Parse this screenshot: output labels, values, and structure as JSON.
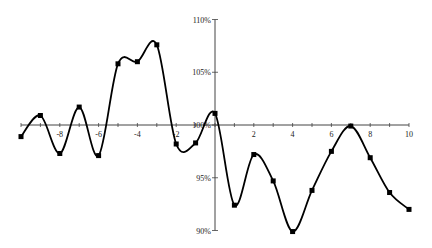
{
  "chart_data": {
    "type": "line",
    "title": "",
    "xlabel": "",
    "ylabel": "",
    "smooth": true,
    "x": [
      -10,
      -9,
      -8,
      -7,
      -6,
      -5,
      -4,
      -3,
      -2,
      -1,
      0,
      1,
      2,
      3,
      4,
      5,
      6,
      7,
      8,
      9,
      10
    ],
    "series": [
      {
        "name": "series",
        "values": [
          98.9,
          100.9,
          97.3,
          101.7,
          97.1,
          105.8,
          106.0,
          107.6,
          98.2,
          98.3,
          101.1,
          92.4,
          97.2,
          94.7,
          89.9,
          93.8,
          97.5,
          99.9,
          96.9,
          93.6,
          92.0
        ]
      }
    ],
    "xlim": [
      -10,
      10
    ],
    "ylim": [
      90,
      110
    ],
    "x_ticks": [
      -8,
      -6,
      -4,
      -2,
      0,
      2,
      4,
      6,
      8,
      10
    ],
    "x_tick_labels": [
      "-8",
      "-6",
      "-4",
      "-2",
      "",
      "2",
      "4",
      "6",
      "8",
      "10"
    ],
    "y_ticks": [
      90,
      95,
      100,
      105,
      110
    ],
    "y_tick_labels": [
      "90%",
      "95%",
      "100%",
      "105%",
      "110%"
    ],
    "axis_cross": {
      "x": 0,
      "y": 100
    },
    "grid": false,
    "legend": "none",
    "colors": {
      "line": "#000000",
      "marker": "#000000",
      "axis": "#444444"
    }
  }
}
